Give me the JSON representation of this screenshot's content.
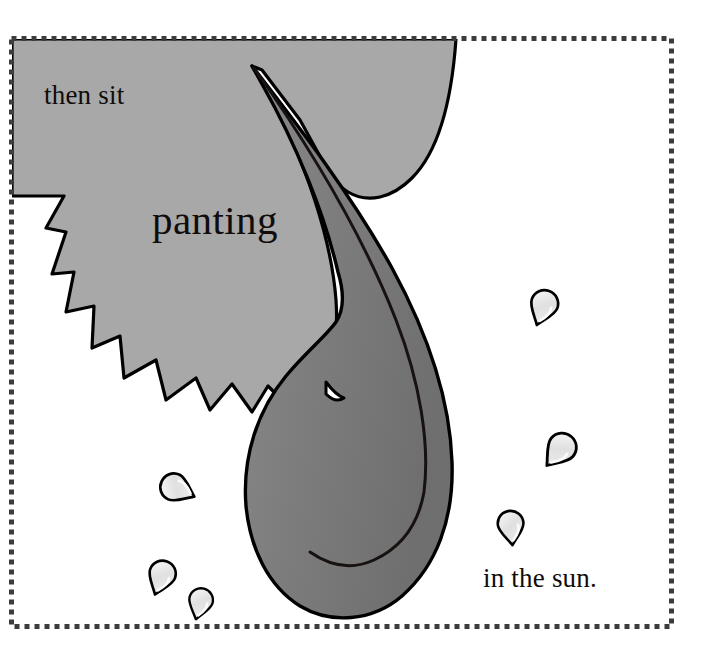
{
  "page": {
    "kind": "picture-book-illustration",
    "background_color": "#ffffff",
    "frame": {
      "name": "dashed-picture-frame",
      "x": 11,
      "y": 38,
      "width": 661,
      "height": 589,
      "stroke_color": "#3c3c3c",
      "style": "fine-dashed"
    }
  },
  "captions": {
    "top_left": "then sit",
    "middle": "panting",
    "bottom_right": "in the sun.",
    "text_color": "#100c0a"
  },
  "artwork": {
    "title": "panting dog in the sun",
    "palette": {
      "head_gray": "#a8a8a8",
      "tongue_gray": "#808080",
      "tongue_shadow": "#6e6e6e",
      "droplet_fill": "#e3e3e3",
      "droplet_highlight": "#f4f4f4",
      "outline": "#000000",
      "paper_white": "#ffffff"
    },
    "shapes": [
      {
        "name": "dog-head-muzzle",
        "fill": "#a8a8a8",
        "description": "large gray head filling the upper-left of the frame"
      },
      {
        "name": "dog-teeth-zigzag",
        "fill": "#ffffff",
        "description": "sawtooth row of white teeth along the lower-left edge of the muzzle"
      },
      {
        "name": "dog-tongue",
        "fill": "#808080",
        "description": "long curved tongue hanging down and to the right"
      },
      {
        "name": "tongue-center-crease",
        "stroke": "#000000",
        "description": "center line along the tongue"
      },
      {
        "name": "sweat-droplet",
        "count": 6,
        "fill": "#e3e3e3",
        "description": "teardrop shaped sweat droplets scattered around the head"
      }
    ],
    "droplets": [
      {
        "id": 1,
        "cx": 543,
        "cy": 308,
        "rotation": 200
      },
      {
        "id": 2,
        "cx": 559,
        "cy": 451,
        "rotation": 220
      },
      {
        "id": 3,
        "cx": 511,
        "cy": 528,
        "rotation": 175
      },
      {
        "id": 4,
        "cx": 178,
        "cy": 489,
        "rotation": 115
      },
      {
        "id": 5,
        "cx": 161,
        "cy": 578,
        "rotation": 200
      },
      {
        "id": 6,
        "cx": 200,
        "cy": 604,
        "rotation": 195
      }
    ]
  }
}
